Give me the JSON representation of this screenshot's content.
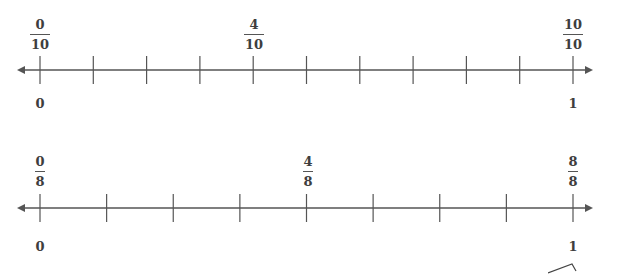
{
  "number_lines": [
    {
      "id": "tenths",
      "denominator": 10,
      "line_y": 70,
      "x_start": 40,
      "x_end": 573,
      "arrow_left_x": 17,
      "arrow_right_x": 593,
      "tick_count": 11,
      "tick_half_height": 14,
      "fraction_labels": [
        {
          "position": 0,
          "numerator": "0",
          "denominator": "10",
          "x": 40
        },
        {
          "position": 4,
          "numerator": "4",
          "denominator": "10",
          "x": 254
        },
        {
          "position": 10,
          "numerator": "10",
          "denominator": "10",
          "x": 573
        }
      ],
      "whole_labels": [
        {
          "value": "0",
          "x": 40
        },
        {
          "value": "1",
          "x": 573
        }
      ],
      "fraction_top": 18,
      "whole_top": 97
    },
    {
      "id": "eighths",
      "denominator": 8,
      "line_y": 208,
      "x_start": 40,
      "x_end": 573,
      "arrow_left_x": 17,
      "arrow_right_x": 593,
      "tick_count": 9,
      "tick_half_height": 14,
      "fraction_labels": [
        {
          "position": 0,
          "numerator": "0",
          "denominator": "8",
          "x": 40
        },
        {
          "position": 4,
          "numerator": "4",
          "denominator": "8",
          "x": 308
        },
        {
          "position": 8,
          "numerator": "8",
          "denominator": "8",
          "x": 573
        }
      ],
      "whole_labels": [
        {
          "value": "0",
          "x": 40
        },
        {
          "value": "1",
          "x": 573
        }
      ],
      "fraction_top": 155,
      "whole_top": 240
    }
  ],
  "colors": {
    "line": "#555555",
    "text": "#3e3e3e",
    "background": "#ffffff"
  }
}
